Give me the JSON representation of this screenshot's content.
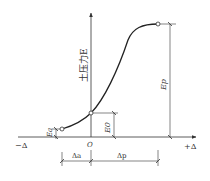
{
  "diagram": {
    "y_axis_label": "土压力E",
    "x_axis_negative": "−Δ",
    "x_axis_positive": "+Δ",
    "origin": "O",
    "labels": {
      "Ea": "Ea",
      "E0": "E0",
      "Ep": "Ep",
      "delta_a": "Δa",
      "delta_p": "Δp"
    },
    "points": [
      {
        "name": "active",
        "x": 62,
        "y": 129
      },
      {
        "name": "at-rest",
        "x": 91,
        "y": 113
      },
      {
        "name": "passive",
        "x": 158,
        "y": 24
      }
    ],
    "colors": {
      "line": "#333333",
      "background": "#ffffff"
    }
  }
}
